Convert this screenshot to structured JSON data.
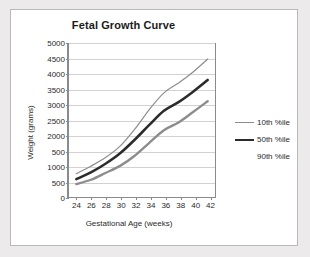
{
  "figure": {
    "background_color": "#eceaea",
    "panel_color": "#ffffff",
    "border_color": "#b9b9b9"
  },
  "chart_data": {
    "type": "line",
    "title": "Fetal Growth Curve",
    "xlabel": "Gestational Age (weeks)",
    "ylabel": "Weight (grams)",
    "x": [
      24,
      26,
      28,
      30,
      32,
      34,
      36,
      38,
      40,
      42
    ],
    "xlim": [
      23,
      43
    ],
    "ylim": [
      0,
      5000
    ],
    "xticks": [
      24,
      26,
      28,
      30,
      32,
      34,
      36,
      38,
      40,
      42
    ],
    "xtick_labels": [
      "24",
      "26",
      "28",
      "30",
      "32",
      "34",
      "36",
      "38",
      "40",
      "42"
    ],
    "yticks": [
      0,
      500,
      1000,
      1500,
      2000,
      2500,
      3000,
      3500,
      4000,
      4500,
      5000
    ],
    "ytick_labels": [
      "0",
      "500",
      "1000",
      "500",
      "2000",
      "2500",
      "3000",
      "3500",
      "4000",
      "4500",
      "5000"
    ],
    "grid": true,
    "grid_axis": "y",
    "grid_color": "#d2d2d2",
    "legend_position": "right",
    "series": [
      {
        "name": "10th %ile",
        "color": "#8c8c8c",
        "width": 2.4,
        "values": [
          420,
          560,
          780,
          1010,
          1340,
          1760,
          2170,
          2420,
          2760,
          3110
        ]
      },
      {
        "name": "50th %ile",
        "color": "#2b2b2b",
        "width": 2.6,
        "values": [
          580,
          800,
          1080,
          1420,
          1860,
          2340,
          2800,
          3080,
          3420,
          3800
        ]
      },
      {
        "name": "90th %ile",
        "color": "#8c8c8c",
        "width": 1.2,
        "values": [
          760,
          1000,
          1280,
          1650,
          2200,
          2840,
          3380,
          3700,
          4060,
          4480
        ]
      }
    ]
  },
  "legend": {
    "entries": [
      {
        "label": "10th %ile",
        "color": "#8c8c8c",
        "thickness": 1,
        "show_swatch": true
      },
      {
        "label": "50th %ile",
        "color": "#2b2b2b",
        "thickness": 2,
        "show_swatch": true
      },
      {
        "label": "90th %ile",
        "color": "#8c8c8c",
        "thickness": 1,
        "show_swatch": false
      }
    ]
  }
}
